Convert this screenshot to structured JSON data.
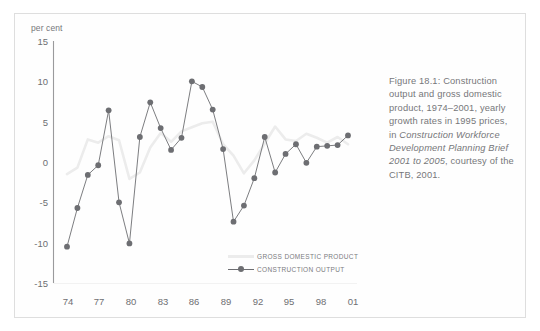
{
  "figure": {
    "caption_segments": [
      {
        "text": "Figure 18.1: Construction output and gross domestic product, 1974–2001, yearly growth rates in 1995 prices, in ",
        "italic": false
      },
      {
        "text": "Construction Workforce Development Planning Brief 2001 to 2005",
        "italic": true
      },
      {
        "text": ", courtesy of the CITB, 2001.",
        "italic": false
      }
    ],
    "caption_plain": "Figure 18.1: Construction output and gross domestic product, 1974–2001, yearly growth rates in 1995 prices, in Construction Workforce Development Planning Brief 2001 to 2005, courtesy of the CITB, 2001."
  },
  "axis": {
    "unit_label": "per cent",
    "y_ticks": [
      "15",
      "10",
      "5",
      "0",
      "-5",
      "-10",
      "-15"
    ],
    "x_ticks": [
      "74",
      "77",
      "80",
      "83",
      "86",
      "89",
      "92",
      "95",
      "98",
      "01"
    ]
  },
  "legend": {
    "items": [
      {
        "label": "GROSS DOMESTIC PRODUCT",
        "color": "#e9e9e9",
        "marker": false
      },
      {
        "label": "CONSTRUCTION OUTPUT",
        "color": "#6d6e72",
        "marker": true
      }
    ]
  },
  "colors": {
    "construction": "#6d6e72",
    "gdp": "#ececec",
    "axis": "#9a9a9c",
    "frame": "#dedede",
    "text": "#76777a"
  },
  "chart_data": {
    "type": "line",
    "title": "Construction output and gross domestic product, 1974–2001, yearly growth rates in 1995 prices",
    "xlabel": "",
    "ylabel": "per cent",
    "ylim": [
      -15,
      15
    ],
    "grid": false,
    "legend_position": "inside-bottom-right",
    "x": [
      1974,
      1975,
      1976,
      1977,
      1978,
      1979,
      1980,
      1981,
      1982,
      1983,
      1984,
      1985,
      1986,
      1987,
      1988,
      1989,
      1990,
      1991,
      1992,
      1993,
      1994,
      1995,
      1996,
      1997,
      1998,
      1999,
      2000,
      2001
    ],
    "x_labels": [
      "74",
      "75",
      "76",
      "77",
      "78",
      "79",
      "80",
      "81",
      "82",
      "83",
      "84",
      "85",
      "86",
      "87",
      "88",
      "89",
      "90",
      "91",
      "92",
      "93",
      "94",
      "95",
      "96",
      "97",
      "98",
      "99",
      "00",
      "01"
    ],
    "series": [
      {
        "name": "CONSTRUCTION OUTPUT",
        "color": "#6d6e72",
        "marker": "circle",
        "values": [
          -10.5,
          -5.7,
          -1.6,
          -0.4,
          6.4,
          -5.0,
          -10.1,
          3.1,
          7.4,
          4.2,
          1.5,
          3.0,
          10.0,
          9.3,
          6.5,
          1.6,
          -7.4,
          -5.4,
          -2.0,
          3.1,
          -1.3,
          1.0,
          2.2,
          -0.1,
          1.9,
          2.0,
          2.1,
          3.3
        ]
      },
      {
        "name": "GROSS DOMESTIC PRODUCT",
        "color": "#ececec",
        "marker": "none",
        "values": [
          -1.5,
          -0.7,
          2.8,
          2.4,
          3.2,
          2.7,
          -2.1,
          -1.3,
          1.8,
          3.6,
          2.5,
          3.8,
          4.3,
          4.8,
          5.0,
          2.2,
          0.8,
          -1.4,
          0.2,
          2.3,
          4.4,
          2.8,
          2.6,
          3.5,
          3.0,
          2.4,
          3.1,
          2.2
        ]
      }
    ]
  }
}
